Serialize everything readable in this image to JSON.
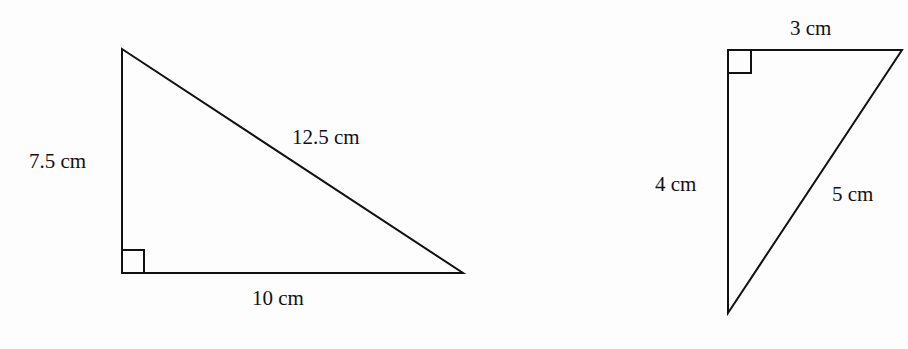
{
  "figures": [
    {
      "name": "triangle-large",
      "right_angle_vertex": "bottom-left",
      "sides": {
        "vertical": "7.5 cm",
        "hypotenuse": "12.5 cm",
        "horizontal": "10 cm"
      }
    },
    {
      "name": "triangle-small",
      "right_angle_vertex": "top-left",
      "sides": {
        "horizontal": "3 cm",
        "vertical": "4 cm",
        "hypotenuse": "5 cm"
      }
    }
  ],
  "colors": {
    "stroke": "#111111",
    "background": "#fdfdfd"
  }
}
